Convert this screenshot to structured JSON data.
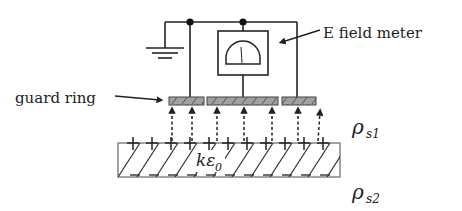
{
  "diagram": {
    "labels": {
      "meter": "E field meter",
      "guard_ring": "guard ring",
      "dielectric": "kε",
      "dielectric_sub": "0",
      "rho_s1": "ρ",
      "rho_s1_sub": "s1",
      "rho_s2": "ρ",
      "rho_s2_sub": "s2"
    },
    "colors": {
      "line": "#222222",
      "plate_fill": "#9a9a9a",
      "hatch": "#333333"
    },
    "components": [
      "ground",
      "E field meter",
      "guard ring",
      "sensing electrode",
      "dielectric layer"
    ],
    "field_arrows": 7,
    "surface_charge": "+"
  }
}
